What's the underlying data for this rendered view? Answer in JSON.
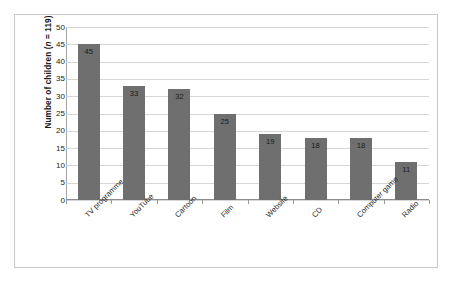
{
  "chart_data": {
    "type": "bar",
    "title": "",
    "xlabel": "",
    "ylabel": "Number of children (n = 119)",
    "ylabel_prefix": "Number of children (",
    "ylabel_italic": "n",
    "ylabel_suffix": " = 119)",
    "categories": [
      "TV programme",
      "YouTube",
      "Cartoon",
      "Film",
      "Website",
      "CD",
      "Computer game",
      "Radio"
    ],
    "values": [
      45,
      33,
      32,
      25,
      19,
      18,
      18,
      11
    ],
    "data_labels": [
      "45",
      "33",
      "32",
      "25",
      "19",
      "18",
      "18",
      "11"
    ],
    "ylim": [
      0,
      50
    ],
    "ytick_step": 5,
    "yticks": [
      "50",
      "45",
      "40",
      "35",
      "30",
      "25",
      "20",
      "15",
      "10",
      "5",
      "0"
    ],
    "ytick_values": [
      50,
      45,
      40,
      35,
      30,
      25,
      20,
      15,
      10,
      5,
      0
    ],
    "grid": true,
    "grid_axis": "y",
    "legend": false,
    "legend_position": "none",
    "bar_color": "#6f6f6f",
    "gridline_color": "#d6d6d6",
    "axis_color": "#8c8c8c",
    "frame_color": "#c8c8c8",
    "background_color": "#ffffff",
    "label_color": "#1a1a1a"
  }
}
